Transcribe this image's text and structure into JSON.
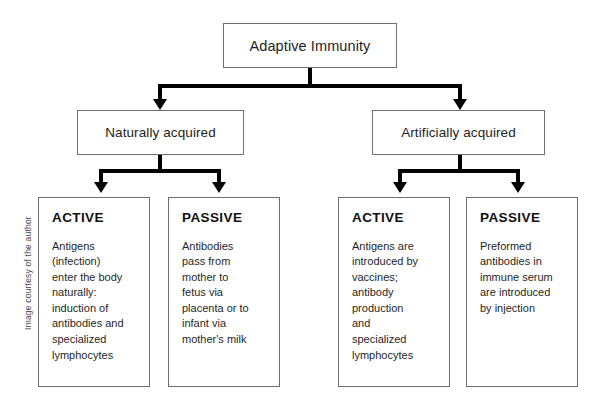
{
  "diagram": {
    "root": {
      "label": "Adaptive Immunity"
    },
    "branches": [
      {
        "label": "Naturally acquired"
      },
      {
        "label": "Artificially acquired"
      }
    ],
    "leaves": [
      {
        "heading": "ACTIVE",
        "body": "Antigens\n(infection)\nenter the body\nnaturally:\ninduction of\nantibodies and\nspecialized\nlymphocytes"
      },
      {
        "heading": "PASSIVE",
        "body": "Antibodies\npass from\nmother to\nfetus via\nplacenta or to\ninfant via\nmother's milk"
      },
      {
        "heading": "ACTIVE",
        "body": "Antigens are\nintroduced by\nvaccines;\nantibody\nproduction\nand\nspecialized\nlymphocytes"
      },
      {
        "heading": "PASSIVE",
        "body": "Preformed\nantibodies in\nimmune serum\nare introduced\nby injection"
      }
    ]
  },
  "credit": {
    "text": "Image courtesy of the author"
  },
  "colors": {
    "connector": "#000000",
    "box_border": "#6e6e6e",
    "background": "#ffffff",
    "text": "#1a1a1a"
  }
}
